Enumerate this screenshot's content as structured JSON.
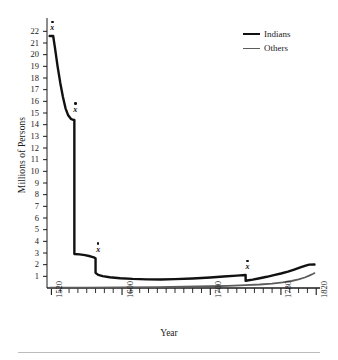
{
  "chart_data": {
    "type": "line",
    "title": "",
    "xlabel": "Year",
    "ylabel": "Millions of Persons",
    "xlim": [
      1515,
      1822
    ],
    "ylim": [
      0,
      22.8
    ],
    "grid": false,
    "legend_position": "top-right",
    "y_ticks": [
      1,
      2,
      3,
      4,
      5,
      6,
      7,
      8,
      9,
      10,
      11,
      12,
      13,
      14,
      15,
      16,
      17,
      18,
      19,
      20,
      21,
      22
    ],
    "x_ticks_labeled": [
      1520,
      1600,
      1700,
      1780,
      1820
    ],
    "x_minor_tick_interval": 10,
    "series": [
      {
        "name": "Indians",
        "color": "#111111",
        "line_width": 2.4,
        "points": [
          [
            1518,
            21.6
          ],
          [
            1522,
            21.6
          ],
          [
            1524,
            20.6
          ],
          [
            1527,
            19.0
          ],
          [
            1530,
            17.6
          ],
          [
            1533,
            16.4
          ],
          [
            1536,
            15.4
          ],
          [
            1539,
            14.8
          ],
          [
            1542,
            14.5
          ],
          [
            1545,
            14.4
          ],
          [
            1546,
            14.4
          ],
          [
            1546,
            2.92
          ],
          [
            1552,
            2.88
          ],
          [
            1558,
            2.82
          ],
          [
            1564,
            2.72
          ],
          [
            1568,
            2.62
          ],
          [
            1570,
            2.55
          ],
          [
            1570,
            1.3
          ],
          [
            1573,
            1.12
          ],
          [
            1578,
            1.02
          ],
          [
            1586,
            0.92
          ],
          [
            1598,
            0.84
          ],
          [
            1612,
            0.78
          ],
          [
            1628,
            0.74
          ],
          [
            1644,
            0.73
          ],
          [
            1660,
            0.76
          ],
          [
            1680,
            0.82
          ],
          [
            1700,
            0.9
          ],
          [
            1715,
            0.98
          ],
          [
            1730,
            1.06
          ],
          [
            1740,
            1.12
          ],
          [
            1740,
            0.62
          ],
          [
            1748,
            0.72
          ],
          [
            1756,
            0.84
          ],
          [
            1764,
            0.96
          ],
          [
            1772,
            1.1
          ],
          [
            1780,
            1.24
          ],
          [
            1788,
            1.4
          ],
          [
            1795,
            1.58
          ],
          [
            1802,
            1.76
          ],
          [
            1808,
            1.92
          ],
          [
            1812,
            2.0
          ],
          [
            1818,
            2.02
          ]
        ]
      },
      {
        "name": "Others",
        "color": "#5c5c5c",
        "line_width": 1.8,
        "points": [
          [
            1518,
            0.02
          ],
          [
            1560,
            0.03
          ],
          [
            1600,
            0.05
          ],
          [
            1640,
            0.08
          ],
          [
            1670,
            0.11
          ],
          [
            1700,
            0.15
          ],
          [
            1720,
            0.19
          ],
          [
            1740,
            0.24
          ],
          [
            1756,
            0.3
          ],
          [
            1770,
            0.38
          ],
          [
            1782,
            0.48
          ],
          [
            1792,
            0.6
          ],
          [
            1800,
            0.74
          ],
          [
            1807,
            0.9
          ],
          [
            1812,
            1.06
          ],
          [
            1816,
            1.2
          ],
          [
            1818,
            1.28
          ]
        ]
      }
    ],
    "annotations": [
      {
        "label": "x",
        "x": 1521,
        "y": 22.5
      },
      {
        "label": "x",
        "x": 1547,
        "y": 15.5
      },
      {
        "label": "x",
        "x": 1573,
        "y": 3.5
      },
      {
        "label": "x",
        "x": 1742,
        "y": 2.0
      }
    ]
  },
  "axes": {
    "y_title": "Millions of Persons",
    "x_title": "Year",
    "y_tick_labels": [
      "22",
      "21",
      "20",
      "19",
      "18",
      "17",
      "16",
      "15",
      "14",
      "13",
      "12",
      "11",
      "10",
      "9",
      "8",
      "7",
      "6",
      "5",
      "4",
      "3",
      "2",
      "1"
    ],
    "x_tick_labels": [
      "1520",
      "1600",
      "1700",
      "1780",
      "1820"
    ]
  },
  "legend": {
    "items": [
      {
        "label": "Indians",
        "color": "#111111"
      },
      {
        "label": "Others",
        "color": "#5c5c5c"
      }
    ]
  }
}
